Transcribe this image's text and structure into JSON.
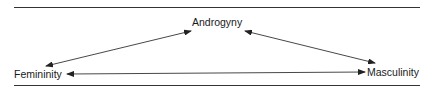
{
  "diagram": {
    "nodes": {
      "top": "Androgyny",
      "left": "Femininity",
      "right": "Masculinity"
    },
    "edges": [
      {
        "from": "Femininity",
        "to": "Androgyny",
        "type": "bidirectional"
      },
      {
        "from": "Androgyny",
        "to": "Masculinity",
        "type": "bidirectional"
      },
      {
        "from": "Femininity",
        "to": "Masculinity",
        "type": "bidirectional"
      }
    ],
    "colors": {
      "line": "#333333",
      "text": "#1a1a1a"
    }
  }
}
